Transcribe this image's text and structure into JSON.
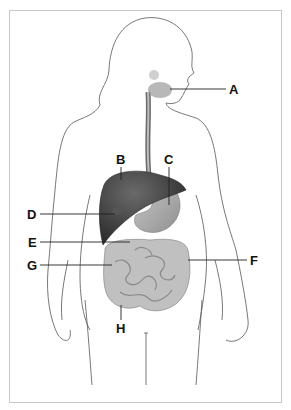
{
  "diagram": {
    "labels": [
      {
        "id": "A",
        "text": "A",
        "x": 229,
        "y": 83
      },
      {
        "id": "B",
        "text": "B",
        "x": 116,
        "y": 153
      },
      {
        "id": "C",
        "text": "C",
        "x": 164,
        "y": 153
      },
      {
        "id": "D",
        "text": "D",
        "x": 27,
        "y": 209
      },
      {
        "id": "E",
        "text": "E",
        "x": 28,
        "y": 237
      },
      {
        "id": "F",
        "text": "F",
        "x": 249,
        "y": 254
      },
      {
        "id": "G",
        "text": "G",
        "x": 27,
        "y": 260
      },
      {
        "id": "H",
        "text": "H",
        "x": 117,
        "y": 323
      }
    ]
  },
  "colors": {
    "frame": "#c8c8c8",
    "outline": "#555555",
    "liver": "#3f3f3f",
    "stomach": "#a8a8a8",
    "intestine": "#b5b5b5",
    "leader": "#222222"
  }
}
